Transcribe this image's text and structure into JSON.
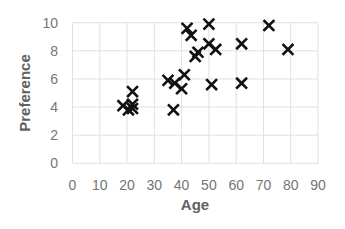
{
  "chart_data": {
    "type": "scatter",
    "title": "",
    "xlabel": "Age",
    "ylabel": "Preference",
    "xlim": [
      0,
      90
    ],
    "ylim": [
      0,
      10
    ],
    "x_ticks": [
      0,
      10,
      20,
      30,
      40,
      50,
      60,
      70,
      80,
      90
    ],
    "y_ticks": [
      0,
      2,
      4,
      6,
      8,
      10
    ],
    "grid": true,
    "legend": null,
    "marker": "x",
    "marker_color": "#111111",
    "series": [
      {
        "name": "Preference vs Age",
        "points": [
          [
            18.5,
            4.1
          ],
          [
            20.5,
            3.8
          ],
          [
            22,
            4.2
          ],
          [
            22,
            3.9
          ],
          [
            22,
            5.1
          ],
          [
            35,
            5.9
          ],
          [
            37.5,
            5.7
          ],
          [
            37,
            3.8
          ],
          [
            40,
            5.3
          ],
          [
            41,
            6.3
          ],
          [
            42,
            9.6
          ],
          [
            43.5,
            9.1
          ],
          [
            45,
            7.6
          ],
          [
            46,
            7.9
          ],
          [
            50,
            9.9
          ],
          [
            50,
            8.5
          ],
          [
            52.5,
            8.1
          ],
          [
            51,
            5.6
          ],
          [
            62,
            8.5
          ],
          [
            62,
            5.7
          ],
          [
            72,
            9.8
          ],
          [
            79,
            8.1
          ]
        ]
      }
    ]
  },
  "colors": {
    "grid": "#e0e0e0",
    "tick_text": "#757575",
    "axis_label": "#616161",
    "marker": "#111111"
  }
}
